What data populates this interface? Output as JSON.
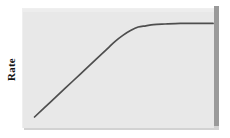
{
  "figure": {
    "background_color": "#ffffff",
    "panel_color": "#e8e8e8",
    "panel_edge_color": "#9a9a9a",
    "curve_color": "#4e4e4e"
  },
  "chart_data": {
    "type": "line",
    "title": "",
    "xlabel": "",
    "ylabel": "Rate",
    "grid": false,
    "legend": null,
    "axis_ticks": {
      "x": [],
      "y": []
    },
    "xlim": [
      0,
      100
    ],
    "ylim": [
      0,
      100
    ],
    "series": [
      {
        "name": "Rate curve",
        "x": [
          6,
          14,
          22,
          30,
          38,
          44,
          48,
          52,
          56,
          60,
          64,
          68,
          74,
          82,
          90,
          99
        ],
        "y": [
          10,
          22,
          34,
          46,
          58,
          67,
          73,
          78,
          82,
          85,
          86,
          87,
          87.5,
          88,
          88,
          88
        ]
      }
    ],
    "annotations": []
  }
}
